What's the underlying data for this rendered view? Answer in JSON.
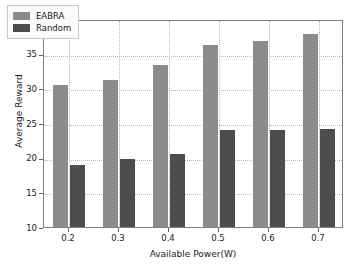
{
  "chart_data": {
    "type": "bar",
    "title": "",
    "xlabel": "Available Power(W)",
    "ylabel": "Average Reward",
    "categories": [
      "0.2",
      "0.3",
      "0.4",
      "0.5",
      "0.6",
      "0.7"
    ],
    "series": [
      {
        "name": "EABRA",
        "color": "#8c8c8c",
        "values": [
          30.5,
          31.2,
          33.3,
          36.3,
          36.9,
          37.8
        ]
      },
      {
        "name": "Random",
        "color": "#4d4d4d",
        "values": [
          19.0,
          19.8,
          20.5,
          24.0,
          24.0,
          24.2
        ]
      }
    ],
    "ylim": [
      10,
      40
    ],
    "yticks": [
      10,
      15,
      20,
      25,
      30,
      35,
      40
    ],
    "ytick_labels": [
      "10",
      "15",
      "20",
      "25",
      "30",
      "35",
      "40"
    ],
    "xtick_labels": [
      "0.2",
      "0.3",
      "0.4",
      "0.5",
      "0.6",
      "0.7"
    ],
    "grid": true,
    "grid_style": "dotted",
    "legend_position": "upper left",
    "background": "#ffffff",
    "frame_color": "#808080"
  }
}
